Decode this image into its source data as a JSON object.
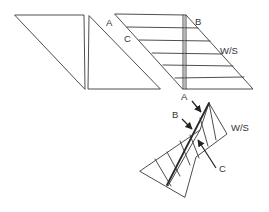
{
  "diagram": {
    "title": "",
    "labels": {
      "top_a": "A",
      "top_c": "C",
      "top_b": "B",
      "top_ws": "W/S",
      "mid_a": "A",
      "bottom_b": "B",
      "bottom_ws": "W/S",
      "bottom_c": "C"
    },
    "colors": {
      "line": "#3a3a3a",
      "text": "#333333",
      "background": "#ffffff"
    }
  }
}
